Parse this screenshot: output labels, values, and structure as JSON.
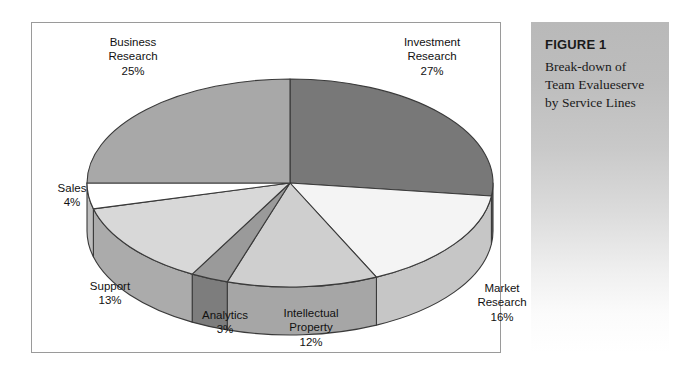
{
  "figure": {
    "number_label": "FIGURE 1",
    "caption_lines": [
      "Break-down of",
      "Team Evalueserve",
      "by Service Lines"
    ]
  },
  "chart_data": {
    "type": "pie",
    "title": "Break-down of Team Evalueserve by Service Lines",
    "subtitle": "FIGURE 1",
    "xlabel": "",
    "ylabel": "",
    "grid": false,
    "legend": "none",
    "value_unit": "%",
    "three_d": true,
    "start_angle_deg": 0,
    "direction": "clockwise",
    "categories": [
      "Investment Research",
      "Market Research",
      "Intellectual Property",
      "Analytics",
      "Support",
      "Sales",
      "Business Research"
    ],
    "values": [
      27,
      16,
      12,
      3,
      13,
      4,
      25
    ],
    "total": 100,
    "slices": [
      {
        "name": "Investment Research",
        "label_lines": [
          "Investment",
          "Research",
          "27%"
        ],
        "value": 27,
        "value_text": "27%",
        "top_color": "#787878",
        "side_color": "#5e5e5e"
      },
      {
        "name": "Market Research",
        "label_lines": [
          "Market",
          "Research",
          "16%"
        ],
        "value": 16,
        "value_text": "16%",
        "top_color": "#f4f4f4",
        "side_color": "#c6c6c6"
      },
      {
        "name": "Intellectual Property",
        "label_lines": [
          "Intellectual",
          "Property",
          "12%"
        ],
        "value": 12,
        "value_text": "12%",
        "top_color": "#cfcfcf",
        "side_color": "#a6a6a6"
      },
      {
        "name": "Analytics",
        "label_lines": [
          "Analytics",
          "3%"
        ],
        "value": 3,
        "value_text": "3%",
        "top_color": "#9a9a9a",
        "side_color": "#7d7d7d"
      },
      {
        "name": "Support",
        "label_lines": [
          "Support",
          "13%"
        ],
        "value": 13,
        "value_text": "13%",
        "top_color": "#d8d8d8",
        "side_color": "#ababab"
      },
      {
        "name": "Sales",
        "label_lines": [
          "Sales",
          "4%"
        ],
        "value": 4,
        "value_text": "4%",
        "top_color": "#ffffff",
        "side_color": "#bdbdbd"
      },
      {
        "name": "Business Research",
        "label_lines": [
          "Business",
          "Research",
          "25%"
        ],
        "value": 25,
        "value_text": "25%",
        "top_color": "#a8a8a8",
        "side_color": "#8b8b8b"
      }
    ]
  },
  "labels": {
    "business": {
      "l1": "Business",
      "l2": "Research",
      "l3": "25%"
    },
    "investment": {
      "l1": "Investment",
      "l2": "Research",
      "l3": "27%"
    },
    "market": {
      "l1": "Market",
      "l2": "Research",
      "l3": "16%"
    },
    "intellectual": {
      "l1": "Intellectual",
      "l2": "Property",
      "l3": "12%"
    },
    "analytics": {
      "l1": "Analytics",
      "l2": "3%"
    },
    "support": {
      "l1": "Support",
      "l2": "13%"
    },
    "sales": {
      "l1": "Sales",
      "l2": "4%"
    }
  },
  "colors": {
    "outline": "#3a3a3a",
    "frame_border": "#9a9a9a",
    "text": "#111111",
    "page_background": "#ffffff"
  }
}
